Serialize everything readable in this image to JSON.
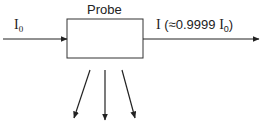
{
  "diagram": {
    "box_label": "Probe",
    "input": {
      "symbol": "I",
      "subscript": "0"
    },
    "output": {
      "symbol": "I",
      "prefix": " (≈0.9999 ",
      "inner_symbol": "I",
      "inner_subscript": "0",
      "suffix": ")"
    },
    "scattered_arrows": 3
  }
}
